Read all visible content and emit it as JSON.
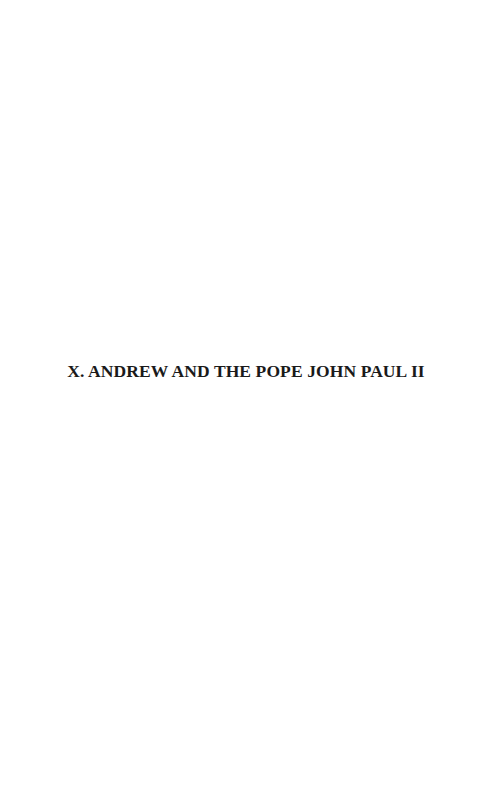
{
  "page": {
    "chapter_title": "X. ANDREW AND THE POPE JOHN PAUL II",
    "colors": {
      "background": "#ffffff",
      "text": "#1a1a1a"
    }
  }
}
